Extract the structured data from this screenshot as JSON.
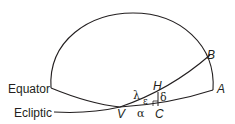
{
  "diagram": {
    "labels": {
      "equator": "Equator",
      "ecliptic": "Ecliptic",
      "point_a": "A",
      "point_b": "B",
      "point_h": "H",
      "point_v": "V",
      "point_c": "C",
      "lambda": "λ",
      "epsilon": "ε",
      "delta": "δ",
      "alpha": "α"
    },
    "colors": {
      "line": "#231f20",
      "background": "#ffffff"
    }
  }
}
